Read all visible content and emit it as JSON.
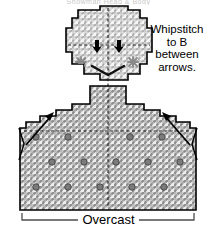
{
  "diagram": {
    "title_partial": "Snowman Head & Body",
    "type": "plastic-canvas-stitch-chart",
    "mesh_color": "#8c8c8c",
    "outline_color": "#000000",
    "symbol_color": "#777777",
    "arrow_color": "#000000"
  },
  "annotations": {
    "note_lines": [
      "Whipstitch",
      "to B",
      "between",
      "arrows."
    ],
    "overcast_label": "Overcast"
  },
  "shapes": {
    "head": {
      "name": "head-piece",
      "outline_points": "78,10 100,10 100,6 128,6 128,10 140,10 140,18 147,18 147,28 152,28 152,52 147,52 147,64 140,64 140,74 128,74 128,80 100,80 100,74 84,74 84,64 72,64 72,52 66,52 66,28 72,28 72,18 78,18 78,10"
    },
    "body": {
      "name": "body-piece",
      "outline_points": "90,86 126,86 126,104 144,104 144,110 160,110 160,116 176,116 176,122 190,122 190,128 196,128 196,210 20,210 20,128 26,128 26,122 40,122 40,116 56,116 56,110 72,110 72,104 90,104 90,86"
    }
  },
  "symbols": {
    "eye_arrows": [
      {
        "name": "eye-arrow-left",
        "x": 96,
        "y": 46
      },
      {
        "name": "eye-arrow-right",
        "x": 118,
        "y": 46
      }
    ],
    "cheek_stars": [
      {
        "name": "cheek-star-left",
        "x": 81,
        "y": 62
      },
      {
        "name": "cheek-star-right",
        "x": 133,
        "y": 62
      }
    ],
    "mouth": {
      "name": "mouth-stitch",
      "path": "M 92,66 L 108,75 L 124,66"
    },
    "body_dots": [
      {
        "x": 36,
        "y": 137
      },
      {
        "x": 68,
        "y": 137
      },
      {
        "x": 130,
        "y": 137
      },
      {
        "x": 162,
        "y": 137
      },
      {
        "x": 52,
        "y": 162
      },
      {
        "x": 84,
        "y": 162
      },
      {
        "x": 116,
        "y": 162
      },
      {
        "x": 148,
        "y": 162
      },
      {
        "x": 180,
        "y": 162
      },
      {
        "x": 36,
        "y": 187
      },
      {
        "x": 68,
        "y": 187
      },
      {
        "x": 100,
        "y": 187
      },
      {
        "x": 132,
        "y": 187
      },
      {
        "x": 164,
        "y": 187
      }
    ]
  },
  "guides": {
    "center_line": {
      "name": "center-fold-line",
      "x": 108,
      "y1": 8,
      "y2": 208
    },
    "head_cross_line": {
      "name": "head-horizontal-guide",
      "y": 45,
      "x1": 68,
      "x2": 150
    },
    "body_cross_line": {
      "name": "body-horizontal-guide",
      "y": 131,
      "x1": 24,
      "x2": 192
    }
  },
  "arrows": {
    "left": {
      "name": "whipstitch-arrow-left",
      "tail_x": 26,
      "tail_y": 145,
      "tip_x": 54,
      "tip_y": 113
    },
    "right": {
      "name": "whipstitch-arrow-right",
      "tail_x": 190,
      "tail_y": 145,
      "tip_x": 162,
      "tip_y": 113
    }
  },
  "brackets": {
    "overcast": {
      "name": "overcast-bracket",
      "x1": 22,
      "x2": 194,
      "y": 219
    }
  }
}
